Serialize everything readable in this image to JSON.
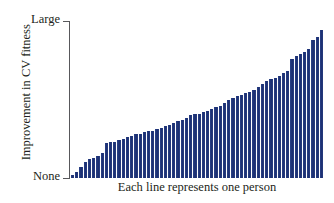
{
  "chart_data": {
    "type": "bar",
    "title": "",
    "subtitle": "",
    "xlabel": "Each line represents one person",
    "ylabel": "Improvement in CV fitness",
    "ytick_labels": [
      "None",
      "Large"
    ],
    "ylim": [
      0,
      100
    ],
    "grid": false,
    "legend": null,
    "bar_color": "#22377d",
    "n_bars": 60,
    "categories": [
      "1",
      "2",
      "3",
      "4",
      "5",
      "6",
      "7",
      "8",
      "9",
      "10",
      "11",
      "12",
      "13",
      "14",
      "15",
      "16",
      "17",
      "18",
      "19",
      "20",
      "21",
      "22",
      "23",
      "24",
      "25",
      "26",
      "27",
      "28",
      "29",
      "30",
      "31",
      "32",
      "33",
      "34",
      "35",
      "36",
      "37",
      "38",
      "39",
      "40",
      "41",
      "42",
      "43",
      "44",
      "45",
      "46",
      "47",
      "48",
      "49",
      "50",
      "51",
      "52",
      "53",
      "54",
      "55",
      "56",
      "57",
      "58",
      "59",
      "60"
    ],
    "values": [
      2,
      4,
      7,
      10,
      12,
      13,
      14,
      16,
      22,
      23,
      23,
      24,
      25,
      26,
      27,
      28,
      28,
      29,
      30,
      30,
      31,
      32,
      33,
      34,
      35,
      36,
      37,
      38,
      40,
      41,
      41,
      42,
      43,
      44,
      45,
      46,
      48,
      50,
      51,
      52,
      53,
      54,
      55,
      56,
      58,
      60,
      62,
      63,
      64,
      65,
      67,
      68,
      76,
      78,
      79,
      80,
      82,
      88,
      90,
      94
    ]
  },
  "axis": {
    "y_title": "Improvement in CV fitness",
    "y_top_label": "Large",
    "y_bottom_label": "None",
    "x_title": "Each line represents one person"
  }
}
